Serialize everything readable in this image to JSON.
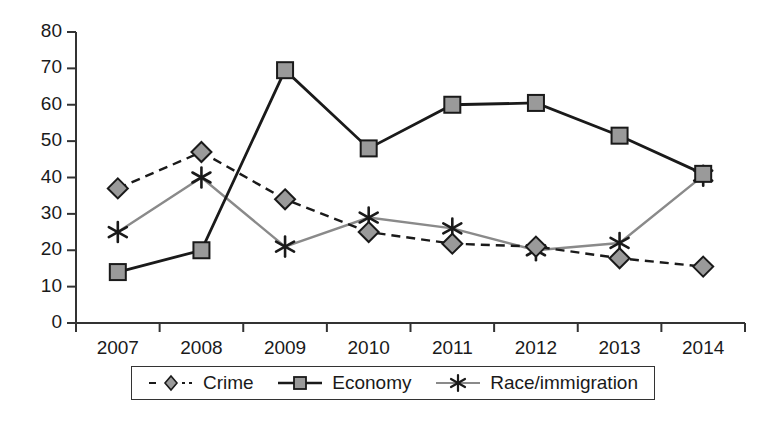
{
  "chart_data": {
    "type": "line",
    "title": "",
    "xlabel": "",
    "ylabel": "",
    "categories": [
      "2007",
      "2008",
      "2009",
      "2010",
      "2011",
      "2012",
      "2013",
      "2014"
    ],
    "ylim": [
      0,
      80
    ],
    "ytick_step": 10,
    "yticks": [
      "0",
      "10",
      "20",
      "30",
      "40",
      "50",
      "60",
      "70",
      "80"
    ],
    "grid": false,
    "legend_position": "bottom",
    "series": [
      {
        "name": "Crime",
        "marker": "diamond",
        "line_style": "dashed",
        "color": "#1a1a1a",
        "marker_fill": "#9a9a9a",
        "values": [
          37,
          47,
          34,
          25,
          21.8,
          21,
          17.8,
          15.5
        ]
      },
      {
        "name": "Economy",
        "marker": "square",
        "line_style": "solid",
        "color": "#1a1a1a",
        "marker_fill": "#9a9a9a",
        "values": [
          14,
          20,
          69.5,
          48,
          60,
          60.5,
          51.5,
          41
        ]
      },
      {
        "name": "Race/immigration",
        "marker": "asterisk",
        "line_style": "solid",
        "color": "#8a8a8a",
        "marker_fill": "#1a1a1a",
        "values": [
          25,
          40,
          21,
          29,
          26,
          20,
          22,
          40.5
        ]
      }
    ]
  },
  "legend": {
    "items": [
      {
        "label": "Crime"
      },
      {
        "label": "Economy"
      },
      {
        "label": "Race/immigration"
      }
    ]
  },
  "colors": {
    "axis": "#333333",
    "dark_line": "#1a1a1a",
    "gray_line": "#8a8a8a",
    "marker_fill": "#9a9a9a",
    "background": "#ffffff"
  }
}
